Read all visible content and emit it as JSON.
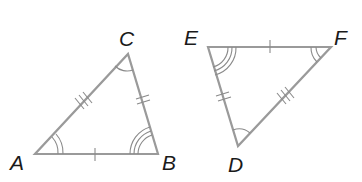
{
  "diagram": {
    "colors": {
      "line": "#9a9a9a",
      "label": "#1a1a1a",
      "background": "#ffffff"
    },
    "triangles": [
      {
        "name": "ABC",
        "vertices": {
          "A": {
            "label": "A",
            "x": 35,
            "y": 154
          },
          "B": {
            "label": "B",
            "x": 158,
            "y": 154
          },
          "C": {
            "label": "C",
            "x": 128,
            "y": 54
          }
        },
        "sides": [
          {
            "name": "AB",
            "ticks": 1
          },
          {
            "name": "BC",
            "ticks": 2
          },
          {
            "name": "CA",
            "ticks": 3
          }
        ],
        "angles": [
          {
            "vertex": "A",
            "arcs": 2
          },
          {
            "vertex": "B",
            "arcs": 3
          },
          {
            "vertex": "C",
            "arcs": 1
          }
        ]
      },
      {
        "name": "DEF",
        "vertices": {
          "E": {
            "label": "E",
            "x": 208,
            "y": 47
          },
          "F": {
            "label": "F",
            "x": 331,
            "y": 47
          },
          "D": {
            "label": "D",
            "x": 238,
            "y": 146
          }
        },
        "sides": [
          {
            "name": "EF",
            "ticks": 1
          },
          {
            "name": "ED",
            "ticks": 2
          },
          {
            "name": "FD",
            "ticks": 3
          }
        ],
        "angles": [
          {
            "vertex": "E",
            "arcs": 3
          },
          {
            "vertex": "F",
            "arcs": 2
          },
          {
            "vertex": "D",
            "arcs": 1
          }
        ]
      }
    ]
  }
}
